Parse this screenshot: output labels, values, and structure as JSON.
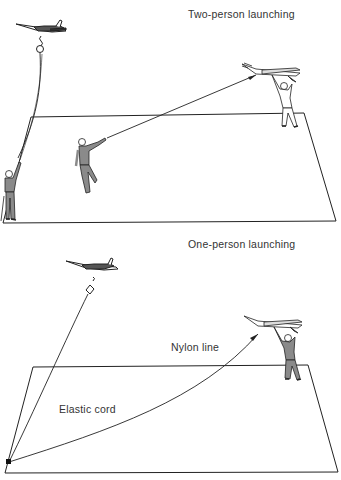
{
  "panels": [
    {
      "title": "Two-person launching",
      "labels": []
    },
    {
      "title": "One-person launching",
      "labels": [
        "Nylon line",
        "Elastic cord"
      ]
    }
  ],
  "colors": {
    "line": "#222222",
    "figure_fill": "#8a8a8a",
    "text": "#333333",
    "background": "#ffffff"
  }
}
